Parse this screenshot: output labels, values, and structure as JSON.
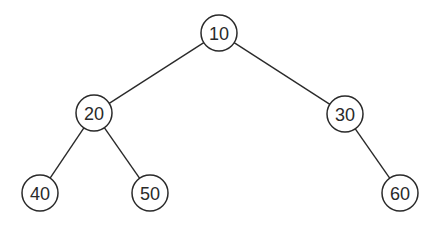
{
  "diagram": {
    "type": "binary-tree",
    "node_radius": 18,
    "stroke_color": "#2a2a2a",
    "background": "#ffffff",
    "nodes": [
      {
        "id": "n10",
        "label": "10",
        "x": 219,
        "y": 33
      },
      {
        "id": "n20",
        "label": "20",
        "x": 94,
        "y": 113
      },
      {
        "id": "n30",
        "label": "30",
        "x": 345,
        "y": 114
      },
      {
        "id": "n40",
        "label": "40",
        "x": 40,
        "y": 193
      },
      {
        "id": "n50",
        "label": "50",
        "x": 150,
        "y": 193
      },
      {
        "id": "n60",
        "label": "60",
        "x": 400,
        "y": 193
      }
    ],
    "edges": [
      {
        "from": "n10",
        "to": "n20"
      },
      {
        "from": "n10",
        "to": "n30"
      },
      {
        "from": "n20",
        "to": "n40"
      },
      {
        "from": "n20",
        "to": "n50"
      },
      {
        "from": "n30",
        "to": "n60"
      }
    ]
  }
}
